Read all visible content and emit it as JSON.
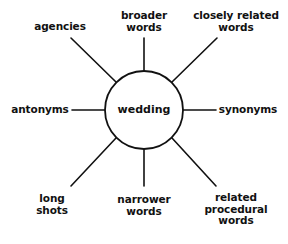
{
  "diagram": {
    "type": "spider / word-association diagram",
    "center": {
      "label": "wedding",
      "cx": 144,
      "cy": 110,
      "r": 39
    },
    "line_color": "#111111",
    "nodes": [
      {
        "id": "agencies",
        "lines": [
          "agencies"
        ],
        "line": [
          71,
          38,
          116,
          82
        ]
      },
      {
        "id": "broader-words",
        "lines": [
          "broader",
          "words"
        ],
        "line": [
          144,
          38,
          144,
          71
        ]
      },
      {
        "id": "closely-related-words",
        "lines": [
          "closely related",
          "words"
        ],
        "line": [
          217,
          38,
          172,
          82
        ]
      },
      {
        "id": "antonyms",
        "lines": [
          "antonyms"
        ],
        "line": [
          72,
          110,
          105,
          110
        ]
      },
      {
        "id": "synonyms",
        "lines": [
          "synonyms"
        ],
        "line": [
          183,
          110,
          216,
          110
        ]
      },
      {
        "id": "long-shots",
        "lines": [
          "long",
          "shots"
        ],
        "line": [
          116,
          138,
          71,
          186
        ]
      },
      {
        "id": "narrower-words",
        "lines": [
          "narrower",
          "words"
        ],
        "line": [
          144,
          149,
          144,
          186
        ]
      },
      {
        "id": "related-procedural-words",
        "lines": [
          "related",
          "procedural",
          "words"
        ],
        "line": [
          172,
          138,
          216,
          186
        ]
      }
    ]
  }
}
